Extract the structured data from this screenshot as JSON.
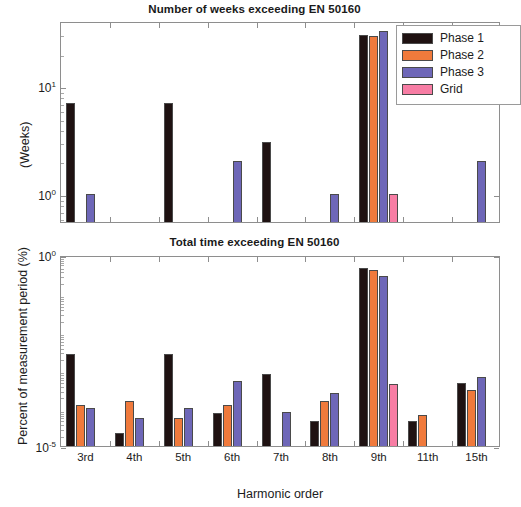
{
  "figure": {
    "width": 509,
    "height": 507,
    "background": "#ffffff"
  },
  "series_colors": {
    "phase1": "#1f1212",
    "phase2": "#f07a3c",
    "phase3": "#6e67b8",
    "grid": "#f77da4"
  },
  "legend": {
    "items": [
      {
        "label": "Phase 1",
        "color": "#1f1212",
        "key": "phase1"
      },
      {
        "label": "Phase 2",
        "color": "#f07a3c",
        "key": "phase2"
      },
      {
        "label": "Phase 3",
        "color": "#6e67b8",
        "key": "phase3"
      },
      {
        "label": "Grid",
        "color": "#f77da4",
        "key": "grid"
      }
    ]
  },
  "chart_data": [
    {
      "id": "weeks",
      "type": "bar",
      "title": "Number of weeks exceeding EN 50160",
      "xlabel": "",
      "ylabel": "(Weeks)",
      "yscale": "log",
      "ylim": [
        0.55,
        40
      ],
      "yticks": [
        "10¹",
        "10⁰"
      ],
      "ytick_values": [
        10,
        1
      ],
      "grid": false,
      "legend_position": "top-right",
      "categories": [
        "3rd",
        "4th",
        "5th",
        "6th",
        "7th",
        "8th",
        "9th",
        "11th",
        "15th"
      ],
      "series": [
        {
          "name": "Phase 1",
          "color": "#1f1212",
          "values": [
            7,
            0,
            7,
            0,
            3,
            0,
            30,
            0,
            0
          ]
        },
        {
          "name": "Phase 2",
          "color": "#f07a3c",
          "values": [
            0,
            0,
            0,
            0,
            0,
            0,
            29,
            0,
            0
          ]
        },
        {
          "name": "Phase 3",
          "color": "#6e67b8",
          "values": [
            1,
            0,
            0,
            2,
            0,
            1,
            32,
            0,
            2
          ]
        },
        {
          "name": "Grid",
          "color": "#f77da4",
          "values": [
            0,
            0,
            0,
            0,
            0,
            0,
            1,
            0,
            0
          ]
        }
      ]
    },
    {
      "id": "total_time",
      "type": "bar",
      "title": "Total time exceeding EN 50160",
      "xlabel": "Harmonic order",
      "ylabel": "Percent of measurement period (%)",
      "yscale": "log",
      "ylim": [
        1e-05,
        1
      ],
      "yticks": [
        "10⁰",
        "10⁻⁵"
      ],
      "ytick_values": [
        1,
        1e-05
      ],
      "grid": false,
      "legend_position": "none",
      "categories": [
        "3rd",
        "4th",
        "5th",
        "6th",
        "7th",
        "8th",
        "9th",
        "11th",
        "15th"
      ],
      "series": [
        {
          "name": "Phase 1",
          "color": "#1f1212",
          "values": [
            0.0025,
            2.2e-05,
            0.0025,
            7.5e-05,
            0.00075,
            4.5e-05,
            0.45,
            4.5e-05,
            0.00045
          ]
        },
        {
          "name": "Phase 2",
          "color": "#f07a3c",
          "values": [
            0.00012,
            0.00015,
            5.5e-05,
            0.00012,
            0,
            0.00015,
            0.4,
            6.5e-05,
            0.0003
          ]
        },
        {
          "name": "Phase 3",
          "color": "#6e67b8",
          "values": [
            0.0001,
            5.5e-05,
            0.0001,
            0.0005,
            8e-05,
            0.00025,
            0.28,
            0,
            0.00065
          ]
        },
        {
          "name": "Grid",
          "color": "#f77da4",
          "values": [
            0,
            0,
            0,
            0,
            0,
            0,
            0.00042,
            0,
            0
          ]
        }
      ]
    }
  ]
}
